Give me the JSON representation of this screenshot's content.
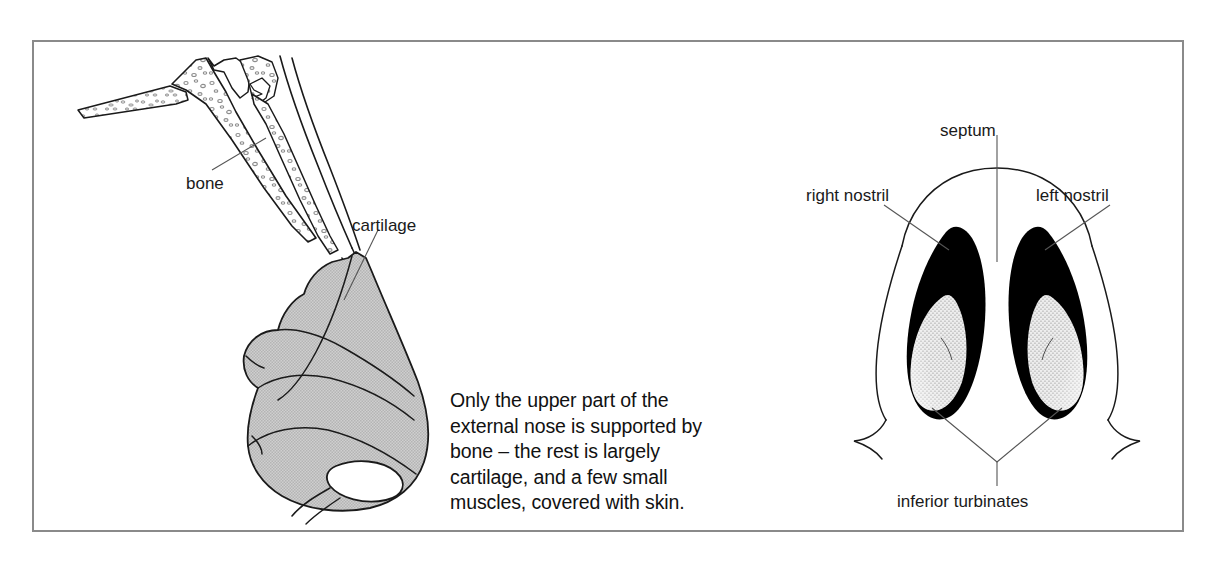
{
  "figure": {
    "border_color": "#8a8a8a",
    "background_color": "#ffffff",
    "caption": {
      "lines": [
        "Only the upper part of the",
        "external nose is supported by",
        "bone – the rest is largely",
        "cartilage, and a few small",
        "muscles, covered with skin."
      ],
      "full_text": "Only the upper part of the external nose is supported by bone – the rest is largely cartilage, and a few small muscles, covered with skin."
    },
    "left_panel": {
      "name": "lateral-nose-skeleton",
      "labels": {
        "bone": "bone",
        "cartilage": "cartilage"
      },
      "colors": {
        "cartilage_fill": "#c6c6c6",
        "bone_fill": "#ffffff",
        "outline": "#1a1a1a",
        "stipple": "#9a9a9a"
      }
    },
    "right_panel": {
      "name": "inferior-nose-view",
      "labels": {
        "septum": "septum",
        "right_nostril": "right nostril",
        "left_nostril": "left nostril",
        "inferior_turbinates": "inferior turbinates"
      },
      "colors": {
        "nostril_fill": "#000000",
        "turbinate_stipple": "#5a5a5a",
        "outline": "#1a1a1a",
        "leader_line": "#555555"
      }
    }
  }
}
